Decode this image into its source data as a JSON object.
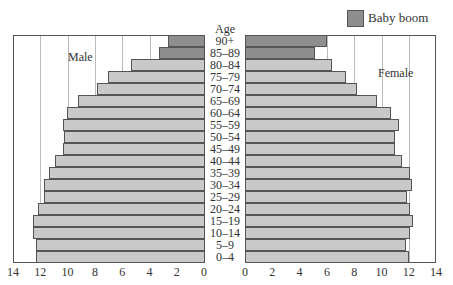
{
  "chart_data": {
    "type": "bar",
    "subtype": "population-pyramid",
    "title": "",
    "center_axis_label": "Age",
    "categories": [
      "90+",
      "85–89",
      "80–84",
      "75–79",
      "70–74",
      "65–69",
      "60–64",
      "55–59",
      "50–54",
      "45–49",
      "40–44",
      "35–39",
      "30–34",
      "25–29",
      "20–24",
      "15–19",
      "10–14",
      "5–9",
      "0–4"
    ],
    "series": [
      {
        "name": "Male",
        "side": "left",
        "values": [
          2.7,
          3.4,
          5.4,
          7.1,
          7.9,
          9.3,
          10.1,
          10.4,
          10.3,
          10.4,
          11.0,
          11.4,
          11.8,
          11.8,
          12.2,
          12.6,
          12.6,
          12.4,
          12.4
        ]
      },
      {
        "name": "Female",
        "side": "right",
        "values": [
          6.0,
          5.1,
          6.4,
          7.4,
          8.2,
          9.7,
          10.7,
          11.3,
          11.0,
          11.0,
          11.5,
          12.1,
          12.2,
          11.9,
          12.1,
          12.3,
          12.1,
          11.8,
          12.0
        ]
      }
    ],
    "highlight": {
      "label": "Baby boom",
      "categories": [
        "90+",
        "85–89"
      ]
    },
    "xlim": [
      0,
      14
    ],
    "x_ticks_left": [
      "14",
      "12",
      "10",
      "8",
      "6",
      "4",
      "2",
      "0"
    ],
    "x_ticks_right": [
      "0",
      "2",
      "4",
      "6",
      "8",
      "10",
      "12",
      "14"
    ],
    "grid": true,
    "legend_position": "top-right",
    "colors": {
      "normal": "#c9c9c9",
      "baby_boom": "#8e8e8e",
      "outline": "#555555"
    }
  },
  "labels": {
    "male": "Male",
    "female": "Female",
    "age": "Age",
    "legend": "Baby boom"
  }
}
